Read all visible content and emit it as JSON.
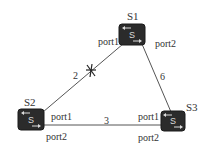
{
  "diagram": {
    "switches": [
      {
        "id": "S1",
        "label": "S1",
        "icon_text": "S",
        "ports": [
          "port1",
          "port2"
        ]
      },
      {
        "id": "S2",
        "label": "S2",
        "icon_text": "S",
        "ports": [
          "port1",
          "port2"
        ]
      },
      {
        "id": "S3",
        "label": "S3",
        "icon_text": "S",
        "ports": [
          "port1",
          "port2"
        ]
      }
    ],
    "links": [
      {
        "from": "S2",
        "to": "S1",
        "cost": "2",
        "blocked": true
      },
      {
        "from": "S1",
        "to": "S3",
        "cost": "6",
        "blocked": false
      },
      {
        "from": "S2",
        "to": "S3",
        "cost": "3",
        "blocked": false
      }
    ],
    "colors": {
      "switch_fill": "#2b2b2b",
      "line": "#555555",
      "text": "#333333"
    }
  }
}
